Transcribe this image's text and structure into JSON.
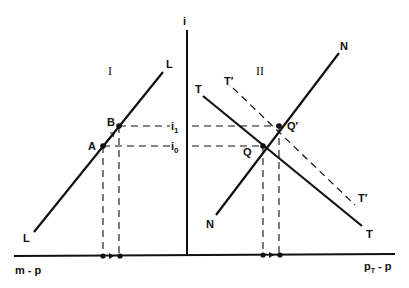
{
  "diagram": {
    "axes": {
      "vertical_label": "i",
      "left_horizontal_label": "m - p",
      "right_horizontal_label_main": "p",
      "right_horizontal_label_sub": "T",
      "right_horizontal_label_rest": " - p"
    },
    "quadrants": {
      "left": "I",
      "right": "II"
    },
    "curves": {
      "L_top": "L",
      "L_bottom": "L",
      "T_top": "T",
      "T_bottom": "T",
      "Tprime_top": "T′",
      "Tprime_bottom": "T′",
      "N_top": "N",
      "N_bottom": "N"
    },
    "points": {
      "A": "A",
      "B": "B",
      "Q": "Q",
      "Qprime": "Q′"
    },
    "levels": {
      "i1_main": "i",
      "i1_sub": "1",
      "i0_main": "i",
      "i0_sub": "0"
    },
    "colors": {
      "ink": "#111111",
      "background": "#ffffff"
    }
  }
}
